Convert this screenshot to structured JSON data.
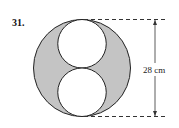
{
  "problem_number": "31.",
  "dimension_label": "28 cm",
  "colors": {
    "shaded": "#c4c4c4",
    "stroke": "#222222",
    "background": "#ffffff"
  },
  "figure": {
    "outer_diameter_cm": 28
  }
}
